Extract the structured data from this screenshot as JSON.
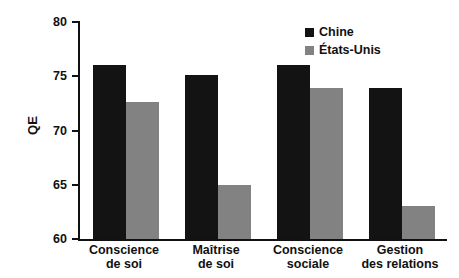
{
  "chart_data": {
    "type": "bar",
    "title": "",
    "subtitle": "",
    "xlabel": "",
    "ylabel": "QE",
    "ylim": [
      60,
      80
    ],
    "yticks": [
      60,
      65,
      70,
      75,
      80
    ],
    "ytick_labels": [
      "60",
      "65",
      "70",
      "75",
      "80"
    ],
    "grid": false,
    "legend_position": "top-right",
    "categories": [
      "Conscience\nde soi",
      "Maîtrise\nde soi",
      "Conscience\nsociale",
      "Gestion\ndes relations"
    ],
    "series": [
      {
        "name": "Chine",
        "color": "#131313",
        "values": [
          76.0,
          75.1,
          76.0,
          73.9
        ]
      },
      {
        "name": "États-Unis",
        "color": "#828282",
        "values": [
          72.6,
          65.0,
          73.9,
          63.0
        ]
      }
    ]
  },
  "legend": {
    "items": [
      {
        "label": "Chine",
        "color": "#131313"
      },
      {
        "label": "États-Unis",
        "color": "#828282"
      }
    ]
  },
  "axes": {
    "y_title": "QE"
  }
}
